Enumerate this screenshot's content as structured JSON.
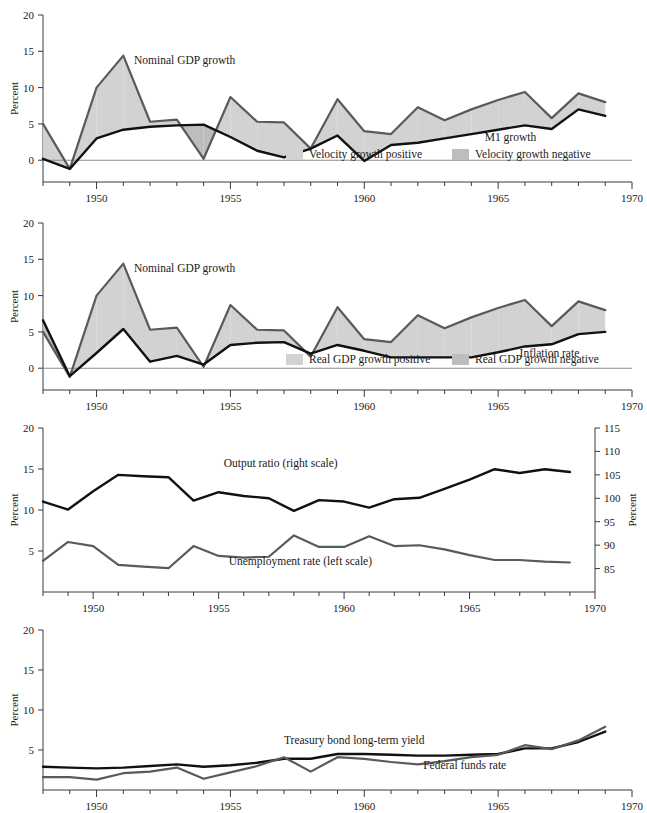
{
  "figure": {
    "background": "#ffffff",
    "fill_positive": "#d2d2d2",
    "fill_negative": "#bdbdbd",
    "line_dark": "#111111",
    "line_gray": "#5a5a5a",
    "axis_color": "#3a3a3a",
    "zero_color": "#8c8c8c"
  },
  "shared": {
    "xlabel": "",
    "x_ticks": [
      1950,
      1955,
      1960,
      1965,
      1970
    ],
    "x_tick_labels": [
      "1950",
      "1955",
      "1960",
      "1965",
      "1970"
    ],
    "xlim": [
      1948,
      1970
    ],
    "ylabel": "Percent",
    "y_ticks": [
      0,
      5,
      10,
      15,
      20
    ],
    "y_tick_labels": [
      "0",
      "5",
      "10",
      "15",
      "20"
    ],
    "ylim": [
      -3,
      20
    ]
  },
  "chart_data": [
    {
      "id": "panel-1",
      "type": "area",
      "title": "",
      "xlabel": "",
      "ylabel": "Percent",
      "xlim": [
        1948,
        1970
      ],
      "ylim": [
        -3,
        20
      ],
      "x_ticks": [
        1950,
        1955,
        1960,
        1965,
        1970
      ],
      "y_ticks": [
        0,
        5,
        10,
        15,
        20
      ],
      "grid": false,
      "x": [
        1948,
        1949,
        1950,
        1951,
        1952,
        1953,
        1954,
        1955,
        1956,
        1957,
        1958,
        1959,
        1960,
        1961,
        1962,
        1963,
        1964,
        1965,
        1966,
        1967,
        1968,
        1969
      ],
      "series": [
        {
          "name": "Nominal GDP growth",
          "color": "#5a5a5a",
          "label_x": 1951.4,
          "label_y": 13.3,
          "values": [
            5.0,
            -1.2,
            10.0,
            14.4,
            5.3,
            5.6,
            0.2,
            8.7,
            5.3,
            5.2,
            1.6,
            8.4,
            4.0,
            3.6,
            7.3,
            5.5,
            7.0,
            8.3,
            9.4,
            5.8,
            9.2,
            8.0
          ]
        },
        {
          "name": "M1 growth",
          "color": "#111111",
          "label_x": 1964.5,
          "label_y": 2.6,
          "values": [
            0.2,
            -1.2,
            3.0,
            4.2,
            4.6,
            4.8,
            4.9,
            3.2,
            1.3,
            0.4,
            1.6,
            3.4,
            -0.1,
            2.1,
            2.4,
            3.0,
            3.6,
            4.2,
            4.8,
            4.3,
            7.0,
            6.1
          ]
        }
      ],
      "legend": {
        "position": "inside-bottom",
        "entries": [
          {
            "label": "Velocity growth positive",
            "color": "#d2d2d2"
          },
          {
            "label": "Velocity growth negative",
            "color": "#bdbdbd"
          }
        ]
      }
    },
    {
      "id": "panel-2",
      "type": "area",
      "title": "",
      "xlabel": "",
      "ylabel": "Percent",
      "xlim": [
        1948,
        1970
      ],
      "ylim": [
        -3,
        20
      ],
      "x_ticks": [
        1950,
        1955,
        1960,
        1965,
        1970
      ],
      "y_ticks": [
        0,
        5,
        10,
        15,
        20
      ],
      "grid": false,
      "x": [
        1948,
        1949,
        1950,
        1951,
        1952,
        1953,
        1954,
        1955,
        1956,
        1957,
        1958,
        1959,
        1960,
        1961,
        1962,
        1963,
        1964,
        1965,
        1966,
        1967,
        1968,
        1969
      ],
      "series": [
        {
          "name": "Nominal GDP growth",
          "color": "#5a5a5a",
          "label_x": 1951.4,
          "label_y": 13.3,
          "values": [
            5.0,
            -1.2,
            10.0,
            14.4,
            5.3,
            5.6,
            0.2,
            8.7,
            5.3,
            5.2,
            1.6,
            8.4,
            4.0,
            3.6,
            7.3,
            5.5,
            7.0,
            8.3,
            9.4,
            5.8,
            9.2,
            8.0
          ]
        },
        {
          "name": "Inflation rate",
          "color": "#111111",
          "label_x": 1965.8,
          "label_y": 1.6,
          "values": [
            6.6,
            -1.1,
            2.1,
            5.4,
            0.9,
            1.7,
            0.5,
            3.2,
            3.5,
            3.6,
            2.0,
            3.2,
            2.4,
            1.5,
            1.5,
            1.5,
            1.5,
            2.2,
            3.0,
            3.3,
            4.7,
            5.0
          ]
        }
      ],
      "legend": {
        "position": "inside-bottom",
        "entries": [
          {
            "label": "Real GDP growth positive",
            "color": "#d2d2d2"
          },
          {
            "label": "Real GDP growth negative",
            "color": "#bdbdbd"
          }
        ]
      }
    },
    {
      "id": "panel-3",
      "type": "line",
      "title": "",
      "xlabel": "",
      "ylabel": "Percent",
      "ylabel_right": "Percent",
      "xlim": [
        1948,
        1970
      ],
      "ylim": [
        0,
        20
      ],
      "ylim_right": [
        80,
        115
      ],
      "x_ticks": [
        1950,
        1955,
        1960,
        1965,
        1970
      ],
      "y_ticks": [
        5,
        10,
        15,
        20
      ],
      "y_ticks_right": [
        85,
        90,
        95,
        100,
        105,
        110,
        115
      ],
      "y_tick_labels_right": [
        "85",
        "90",
        "95",
        "100",
        "105",
        "110",
        "115"
      ],
      "grid": false,
      "x": [
        1948,
        1949,
        1950,
        1951,
        1952,
        1953,
        1954,
        1955,
        1956,
        1957,
        1958,
        1959,
        1960,
        1961,
        1962,
        1963,
        1964,
        1965,
        1966,
        1967,
        1968,
        1969
      ],
      "series": [
        {
          "name": "Output ratio (right scale)",
          "axis": "right",
          "color": "#111111",
          "label_x": 1955.2,
          "label_y": 15.2,
          "values": [
            99.3,
            97.6,
            101.5,
            105.0,
            104.7,
            104.5,
            99.5,
            101.3,
            100.5,
            100.0,
            97.3,
            99.6,
            99.3,
            98.0,
            99.8,
            100.1,
            102.0,
            104.0,
            106.2,
            105.4,
            106.2,
            105.6
          ]
        },
        {
          "name": "Unemployment rate (left scale)",
          "axis": "left",
          "color": "#5a5a5a",
          "label_x": 1955.4,
          "label_y": 3.3,
          "values": [
            3.8,
            6.1,
            5.6,
            3.3,
            3.1,
            2.9,
            5.6,
            4.4,
            4.2,
            4.3,
            6.9,
            5.5,
            5.5,
            6.8,
            5.6,
            5.7,
            5.2,
            4.5,
            3.9,
            3.9,
            3.7,
            3.6
          ]
        }
      ]
    },
    {
      "id": "panel-4",
      "type": "line",
      "title": "",
      "xlabel": "",
      "ylabel": "Percent",
      "xlim": [
        1948,
        1970
      ],
      "ylim": [
        0,
        20
      ],
      "x_ticks": [
        1950,
        1955,
        1960,
        1965,
        1970
      ],
      "y_ticks": [
        5,
        10,
        15,
        20
      ],
      "grid": false,
      "x": [
        1948,
        1949,
        1950,
        1951,
        1952,
        1953,
        1954,
        1955,
        1956,
        1957,
        1958,
        1959,
        1960,
        1961,
        1962,
        1963,
        1964,
        1965,
        1966,
        1967,
        1968,
        1969
      ],
      "series": [
        {
          "name": "Treasury bond long-term yield",
          "color": "#111111",
          "label_x": 1957.0,
          "label_y": 5.7,
          "values": [
            2.9,
            2.8,
            2.7,
            2.8,
            3.0,
            3.2,
            2.9,
            3.1,
            3.4,
            3.9,
            3.9,
            4.5,
            4.5,
            4.4,
            4.3,
            4.3,
            4.4,
            4.5,
            5.2,
            5.2,
            6.0,
            7.3
          ]
        },
        {
          "name": "Federal funds rate",
          "color": "#5a5a5a",
          "label_x": 1962.2,
          "label_y": 2.6,
          "values": [
            1.6,
            1.6,
            1.3,
            2.1,
            2.3,
            2.8,
            1.4,
            2.2,
            3.0,
            4.1,
            2.3,
            4.1,
            3.9,
            3.5,
            3.2,
            3.6,
            4.1,
            4.4,
            5.6,
            5.1,
            6.2,
            7.9
          ]
        }
      ]
    }
  ]
}
